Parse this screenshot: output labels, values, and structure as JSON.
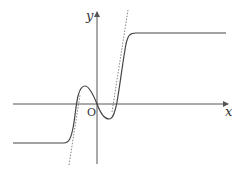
{
  "diagram": {
    "type": "function-graph",
    "axes": {
      "x_label": "x",
      "y_label": "y",
      "origin_label": "O"
    },
    "features": {
      "curve": "solid smooth curve with horizontal plateau on left (below x-axis) and right (above x-axis), a local maximum left of y-axis and local minimum right of y-axis",
      "asymptote_lines": "two dotted slanted guide lines tangent to the steep parts of the curve"
    },
    "colors": {
      "axis": "#555555",
      "curve": "#444444",
      "dotted": "#666666",
      "background": "#ffffff"
    }
  }
}
